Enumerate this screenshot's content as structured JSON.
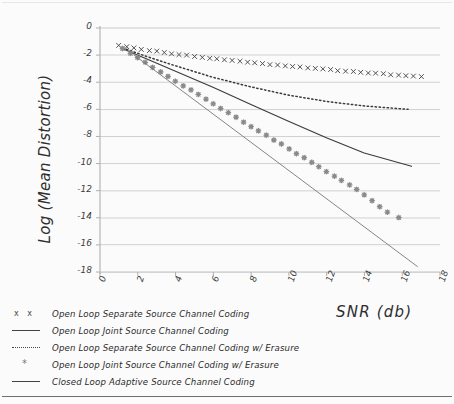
{
  "chart_data": {
    "type": "line",
    "title": "",
    "xlabel": "SNR (db)",
    "ylabel": "Log (Mean Distortion)",
    "xlim": [
      0,
      18
    ],
    "ylim": [
      -18,
      0
    ],
    "xticks": [
      0,
      2,
      4,
      6,
      8,
      10,
      12,
      14,
      16,
      18
    ],
    "yticks": [
      0,
      -2,
      -4,
      -6,
      -8,
      -10,
      -12,
      -14,
      -16,
      -18
    ],
    "xtick_labels": [
      "0",
      "2",
      "4",
      "6",
      "8",
      "10",
      "12",
      "14",
      "16",
      "18"
    ],
    "ytick_labels": [
      "0",
      "-2",
      "-4",
      "-6",
      "-8",
      "-10",
      "-12",
      "-14",
      "-16",
      "-18"
    ],
    "grid": "horizontal",
    "legend_position": "below-left",
    "style": "hand-drawn sketch",
    "series": [
      {
        "name": "Open Loop Separate Source Channel Coding",
        "marker": "x",
        "line": "none",
        "color": "#4a4a4a",
        "x": [
          1.0,
          1.4,
          1.8,
          2.2,
          2.6,
          3.0,
          3.4,
          3.8,
          4.2,
          4.6,
          5.0,
          5.4,
          5.8,
          6.2,
          6.6,
          7.0,
          7.4,
          7.8,
          8.2,
          8.6,
          9.0,
          9.4,
          9.8,
          10.2,
          10.6,
          11.0,
          11.4,
          11.8,
          12.2,
          12.6,
          13.0,
          13.4,
          13.8,
          14.2,
          14.6,
          15.0,
          15.4,
          15.8,
          16.2,
          16.6,
          17.0
        ],
        "y": [
          -1.3,
          -1.4,
          -1.49,
          -1.57,
          -1.65,
          -1.73,
          -1.81,
          -1.88,
          -1.95,
          -2.02,
          -2.09,
          -2.15,
          -2.22,
          -2.28,
          -2.34,
          -2.4,
          -2.46,
          -2.52,
          -2.57,
          -2.63,
          -2.68,
          -2.74,
          -2.79,
          -2.84,
          -2.89,
          -2.94,
          -2.99,
          -3.04,
          -3.08,
          -3.13,
          -3.18,
          -3.22,
          -3.27,
          -3.31,
          -3.35,
          -3.4,
          -3.44,
          -3.48,
          -3.52,
          -3.56,
          -3.6
        ]
      },
      {
        "name": "Open Loop Joint Source Channel Coding",
        "marker": "none",
        "line": "solid",
        "color": "#3a3a3a",
        "x": [
          1.2,
          2.5,
          4.0,
          6.0,
          8.0,
          10.0,
          12.0,
          14.0,
          16.5
        ],
        "y": [
          -1.55,
          -2.3,
          -3.2,
          -4.4,
          -5.65,
          -6.9,
          -8.1,
          -9.2,
          -10.2
        ]
      },
      {
        "name": "Open Loop Separate Source Channel Coding w/ Erasure",
        "marker": "none",
        "line": "dotted",
        "color": "#3a3a3a",
        "x": [
          1.2,
          2.5,
          4.0,
          6.0,
          8.0,
          10.0,
          12.0,
          14.0,
          16.3
        ],
        "y": [
          -1.45,
          -2.1,
          -2.8,
          -3.65,
          -4.35,
          -4.95,
          -5.4,
          -5.75,
          -6.0
        ]
      },
      {
        "name": "Open Loop Joint Source Channel Coding w/ Erasure",
        "marker": "star",
        "line": "none",
        "color": "#8a8a8a",
        "x": [
          1.2,
          1.6,
          2.0,
          2.4,
          2.8,
          3.2,
          3.6,
          4.0,
          4.4,
          4.8,
          5.2,
          5.6,
          6.0,
          6.4,
          6.8,
          7.2,
          7.6,
          8.0,
          8.4,
          8.8,
          9.2,
          9.6,
          10.0,
          10.4,
          10.8,
          11.2,
          11.6,
          12.0,
          12.4,
          12.8,
          13.2,
          13.6,
          14.0,
          14.4,
          14.8,
          15.2,
          15.8
        ],
        "y": [
          -1.5,
          -1.85,
          -2.2,
          -2.55,
          -2.9,
          -3.25,
          -3.58,
          -3.92,
          -4.25,
          -4.58,
          -4.92,
          -5.25,
          -5.58,
          -5.92,
          -6.25,
          -6.58,
          -6.92,
          -7.25,
          -7.58,
          -7.92,
          -8.25,
          -8.58,
          -8.92,
          -9.25,
          -9.58,
          -9.92,
          -10.25,
          -10.58,
          -10.92,
          -11.25,
          -11.58,
          -11.92,
          -12.3,
          -12.75,
          -13.2,
          -13.6,
          -14.0
        ]
      },
      {
        "name": "Closed Loop Adaptive Source Channel Coding",
        "marker": "none",
        "line": "solid-thin",
        "color": "#777777",
        "x": [
          1.8,
          16.8
        ],
        "y": [
          -2.0,
          -17.6
        ]
      }
    ]
  },
  "legend": {
    "items": [
      {
        "key": "x x",
        "key_type": "xx-marker",
        "label": "Open Loop Separate Source Channel Coding"
      },
      {
        "key": "—",
        "key_type": "solid-line",
        "label": "Open Loop Joint Source Channel Coding"
      },
      {
        "key": "····",
        "key_type": "dotted-line",
        "label": "Open Loop Separate Source Channel Coding w/ Erasure"
      },
      {
        "key": "*",
        "key_type": "star-marker",
        "label": "Open Loop Joint Source Channel Coding w/ Erasure"
      },
      {
        "key": "—",
        "key_type": "solid-line",
        "label": "Closed Loop Adaptive Source Channel Coding"
      }
    ]
  },
  "colors": {
    "background": "#fbfbfb",
    "gridline": "#c9c9c9",
    "axis": "#b0b0b0",
    "text": "#2e2e2e"
  }
}
